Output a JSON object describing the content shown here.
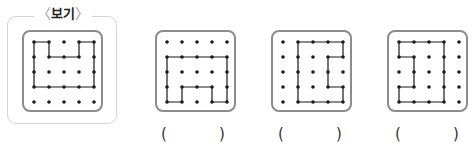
{
  "example": {
    "label_open": "〈",
    "label": "보기",
    "label_close": "〉"
  },
  "grid": {
    "rows": 5,
    "cols": 5,
    "spacing": 15,
    "dot_color": "#1a1a1a",
    "line_color": "#1a1a1a",
    "frame_color": "#8c8c8c"
  },
  "figures": [
    {
      "id": "example",
      "polygon": [
        [
          0,
          0
        ],
        [
          1,
          0
        ],
        [
          1,
          1
        ],
        [
          3,
          1
        ],
        [
          3,
          0
        ],
        [
          4,
          0
        ],
        [
          4,
          3
        ],
        [
          0,
          3
        ]
      ]
    },
    {
      "id": "option-1",
      "polygon": [
        [
          0,
          1
        ],
        [
          4,
          1
        ],
        [
          4,
          4
        ],
        [
          3,
          4
        ],
        [
          3,
          3
        ],
        [
          1,
          3
        ],
        [
          1,
          4
        ],
        [
          0,
          4
        ]
      ]
    },
    {
      "id": "option-2",
      "polygon": [
        [
          1,
          0
        ],
        [
          4,
          0
        ],
        [
          4,
          1
        ],
        [
          3,
          1
        ],
        [
          3,
          3
        ],
        [
          4,
          3
        ],
        [
          4,
          4
        ],
        [
          1,
          4
        ]
      ]
    },
    {
      "id": "option-3",
      "polygon": [
        [
          0,
          0
        ],
        [
          3,
          0
        ],
        [
          3,
          4
        ],
        [
          0,
          4
        ],
        [
          0,
          3
        ],
        [
          1,
          3
        ],
        [
          1,
          1
        ],
        [
          0,
          1
        ]
      ]
    }
  ],
  "answers": [
    {
      "open": "(",
      "value": "",
      "close": ")"
    },
    {
      "open": "(",
      "value": "",
      "close": ")"
    },
    {
      "open": "(",
      "value": "",
      "close": ")"
    }
  ]
}
